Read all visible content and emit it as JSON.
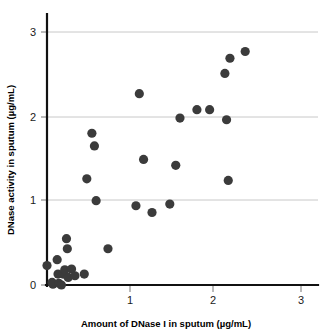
{
  "chart_data": {
    "type": "scatter",
    "title": "",
    "xlabel": "Amount of DNase I in sputum (µg/mL)",
    "ylabel": "DNase activity in sputum  (µg/mL)",
    "xlim": [
      0,
      3.25
    ],
    "ylim": [
      0,
      3.25
    ],
    "xticks": [
      1,
      2,
      3
    ],
    "xtick_labels": [
      "1",
      "2",
      "3"
    ],
    "yticks": [
      0,
      1,
      2,
      3
    ],
    "ytick_labels": [
      "0",
      "1",
      "2",
      "3"
    ],
    "grid": "horizontal",
    "gridlines_y": [
      1,
      2,
      3
    ],
    "legend": "none",
    "marker": "filled-circle",
    "marker_color": "#3b3b3b",
    "axis_color": "#111111",
    "grid_color": "#c8c8c8",
    "n_points": 38,
    "points": [
      {
        "x": 0.0,
        "y": 0.23
      },
      {
        "x": 0.06,
        "y": 0.03
      },
      {
        "x": 0.07,
        "y": 0.01
      },
      {
        "x": 0.12,
        "y": 0.3
      },
      {
        "x": 0.13,
        "y": 0.13
      },
      {
        "x": 0.14,
        "y": 0.02
      },
      {
        "x": 0.17,
        "y": 0.0
      },
      {
        "x": 0.19,
        "y": 0.13
      },
      {
        "x": 0.21,
        "y": 0.18
      },
      {
        "x": 0.23,
        "y": 0.55
      },
      {
        "x": 0.24,
        "y": 0.43
      },
      {
        "x": 0.25,
        "y": 0.09
      },
      {
        "x": 0.29,
        "y": 0.19
      },
      {
        "x": 0.33,
        "y": 0.11
      },
      {
        "x": 0.44,
        "y": 0.13
      },
      {
        "x": 0.47,
        "y": 1.26
      },
      {
        "x": 0.53,
        "y": 1.8
      },
      {
        "x": 0.56,
        "y": 1.65
      },
      {
        "x": 0.58,
        "y": 1.0
      },
      {
        "x": 0.72,
        "y": 0.43
      },
      {
        "x": 1.05,
        "y": 0.94
      },
      {
        "x": 1.09,
        "y": 2.27
      },
      {
        "x": 1.14,
        "y": 1.49
      },
      {
        "x": 1.24,
        "y": 0.86
      },
      {
        "x": 1.45,
        "y": 0.96
      },
      {
        "x": 1.52,
        "y": 1.42
      },
      {
        "x": 1.57,
        "y": 1.98
      },
      {
        "x": 1.77,
        "y": 2.08
      },
      {
        "x": 1.92,
        "y": 2.08
      },
      {
        "x": 2.1,
        "y": 2.51
      },
      {
        "x": 2.12,
        "y": 1.96
      },
      {
        "x": 2.14,
        "y": 1.24
      },
      {
        "x": 2.16,
        "y": 2.69
      },
      {
        "x": 2.34,
        "y": 2.77
      }
    ]
  }
}
